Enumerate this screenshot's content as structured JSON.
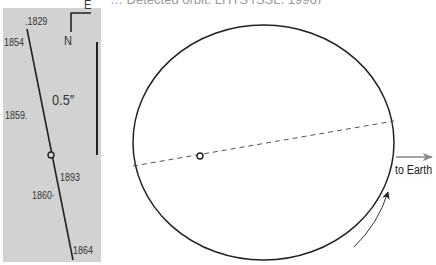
{
  "header": {
    "title_fragment": "… Detected orbit, LHTS (SSL, 1996)"
  },
  "left_panel": {
    "background": "#d2d2d2",
    "compass": {
      "east_label": "E",
      "north_label": "N"
    },
    "scale_bar": {
      "label": "0.5″"
    },
    "epochs": [
      {
        "label": ".1829"
      },
      {
        "label": "1854"
      },
      {
        "label": "1859."
      },
      {
        "label": "1893"
      },
      {
        "label": "1860·"
      },
      {
        "label": "1864"
      }
    ]
  },
  "orbit_diagram": {
    "ellipse": {
      "cx": 263.5,
      "cy": 142.5,
      "rx": 130.5,
      "ry": 117.5,
      "stroke": "#222222"
    },
    "line_of_nodes": {
      "x1": 133,
      "y1": 166,
      "x2": 394,
      "y2": 121,
      "style": "dashed",
      "stroke": "#555555"
    },
    "primary_star": {
      "cx": 200,
      "cy": 156,
      "r": 3
    },
    "direction_arrow": {
      "label": "to Earth",
      "color": "#888888"
    },
    "motion_arrow": {
      "color": "#222222"
    }
  }
}
